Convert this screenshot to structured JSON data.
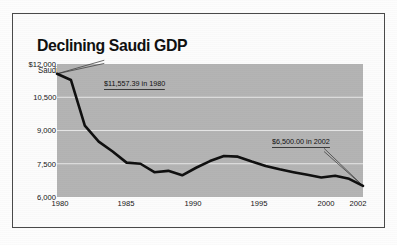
{
  "chart_data": {
    "type": "line",
    "title": "Declining Saudi GDP",
    "subtitle": "Saudi GDP per capita",
    "xlabel": "",
    "ylabel": "Saudi GDP per capita",
    "ylim": [
      6000,
      12000
    ],
    "xlim": [
      1980,
      2002
    ],
    "grid": true,
    "legend": "none",
    "line_color": "#101010",
    "plot_background": "#b4b4b4",
    "gridline_color": "#e8e8e8",
    "y_ticks": [
      "$12,000",
      "10,500",
      "9,000",
      "7,500",
      "6,000"
    ],
    "y_tick_values": [
      12000,
      10500,
      9000,
      7500,
      6000
    ],
    "x_ticks": [
      "1980",
      "1985",
      "1990",
      "1995",
      "2000",
      "2002"
    ],
    "x_tick_values": [
      1980,
      1985,
      1990,
      1995,
      2000,
      2002
    ],
    "x": [
      1980,
      1981,
      1982,
      1983,
      1984,
      1985,
      1986,
      1987,
      1988,
      1989,
      1990,
      1991,
      1992,
      1993,
      1994,
      1995,
      1996,
      1997,
      1998,
      1999,
      2000,
      2001,
      2002
    ],
    "values": [
      11557.39,
      11280,
      9220,
      8500,
      8050,
      7550,
      7500,
      7120,
      7180,
      6980,
      7320,
      7620,
      7850,
      7820,
      7600,
      7400,
      7250,
      7120,
      7000,
      6880,
      6960,
      6820,
      6500
    ],
    "series": [
      {
        "name": "Saudi GDP per capita",
        "values": [
          11557.39,
          11280,
          9220,
          8500,
          8050,
          7550,
          7500,
          7120,
          7180,
          6980,
          7320,
          7620,
          7850,
          7820,
          7600,
          7400,
          7250,
          7120,
          7000,
          6880,
          6960,
          6820,
          6500
        ]
      }
    ],
    "annotations": [
      {
        "text": "$11,557.39 in 1980",
        "value": 11557.39,
        "year": 1980
      },
      {
        "text": "$6,500.00 in 2002",
        "value": 6500.0,
        "year": 2002
      }
    ]
  }
}
